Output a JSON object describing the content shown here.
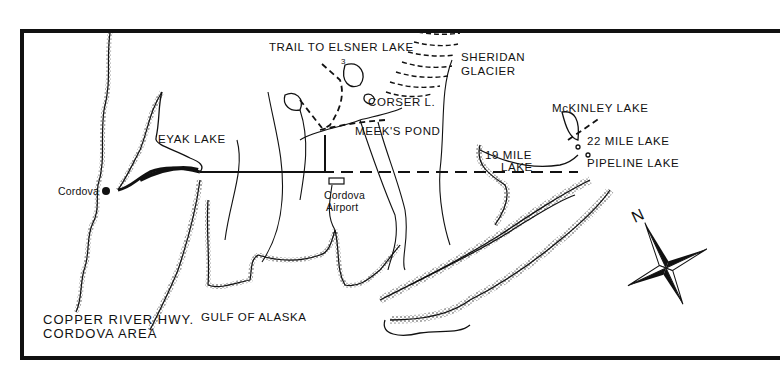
{
  "map": {
    "title_line1": "COPPER RIVER HWY.",
    "title_line2": "CORDOVA AREA",
    "labels": {
      "trail": "TRAIL TO ELSNER LAKE",
      "trail_marker": "3",
      "glacier_line1": "SHERIDAN",
      "glacier_line2": "GLACIER",
      "corser": "CORSER L.",
      "meeks": "MEEK'S POND",
      "eyak": "EYAK LAKE",
      "cordova": "Cordova",
      "airport_line1": "Cordova",
      "airport_line2": "Airport",
      "mile19_line1": "19 MILE",
      "mile19_line2": "LAKE",
      "mckinley": "McKINLEY LAKE",
      "mile22": "22 MILE LAKE",
      "pipeline": "PIPELINE LAKE",
      "gulf": "GULF OF ALASKA",
      "north": "N"
    },
    "colors": {
      "ink": "#111111",
      "paper": "#ffffff"
    }
  }
}
